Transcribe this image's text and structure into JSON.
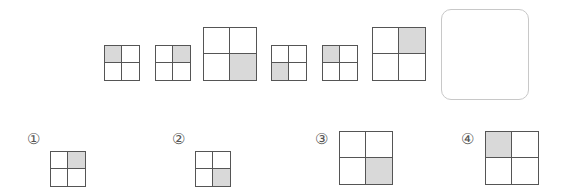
{
  "sequence": {
    "items": [
      {
        "size": "small",
        "shaded_cell": "top-left",
        "x": 104,
        "y": 45,
        "w": 36
      },
      {
        "size": "small",
        "shaded_cell": "top-right",
        "x": 155,
        "y": 45,
        "w": 36
      },
      {
        "size": "large",
        "shaded_cell": "bottom-right",
        "x": 203,
        "y": 27,
        "w": 54
      },
      {
        "size": "small",
        "shaded_cell": "bottom-left",
        "x": 271,
        "y": 45,
        "w": 36
      },
      {
        "size": "small",
        "shaded_cell": "top-left",
        "x": 322,
        "y": 45,
        "w": 36
      },
      {
        "size": "large",
        "shaded_cell": "top-right",
        "x": 372,
        "y": 27,
        "w": 54
      }
    ],
    "answer_placeholder": "empty-answer-box"
  },
  "options": [
    {
      "label": "①",
      "size": "small",
      "shaded_cell": "top-right",
      "lx": 27,
      "ly": 131,
      "x": 50,
      "y": 151,
      "w": 36
    },
    {
      "label": "②",
      "size": "small",
      "shaded_cell": "bottom-right",
      "lx": 172,
      "ly": 131,
      "x": 195,
      "y": 151,
      "w": 36
    },
    {
      "label": "③",
      "size": "large",
      "shaded_cell": "bottom-right",
      "lx": 315,
      "ly": 131,
      "x": 339,
      "y": 131,
      "w": 54
    },
    {
      "label": "④",
      "size": "large",
      "shaded_cell": "top-left",
      "lx": 461,
      "ly": 131,
      "x": 485,
      "y": 131,
      "w": 54
    }
  ],
  "colors": {
    "shade": "#d9d9d9",
    "line": "#555555",
    "answer_border": "#c8c8c8"
  }
}
